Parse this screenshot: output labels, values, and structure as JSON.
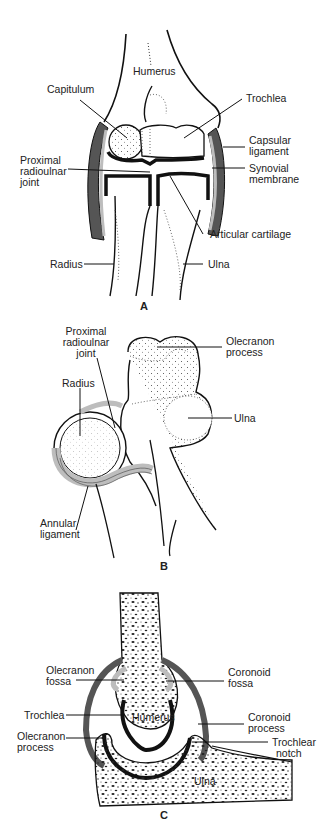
{
  "figure": {
    "panels": [
      {
        "id": "A",
        "letter": "A",
        "labels": {
          "humerus": "Humerus",
          "capitulum": "Capitulum",
          "trochlea": "Trochlea",
          "capsular_ligament_1": "Capsular",
          "capsular_ligament_2": "ligament",
          "proximal_radioulnar_1": "Proximal",
          "proximal_radioulnar_2": "radioulnar",
          "proximal_radioulnar_3": "joint",
          "synovial_membrane_1": "Synovial",
          "synovial_membrane_2": "membrane",
          "articular_cartilage": "Articular cartilage",
          "radius": "Radius",
          "ulna": "Ulna"
        }
      },
      {
        "id": "B",
        "letter": "B",
        "labels": {
          "proximal_radioulnar_1": "Proximal",
          "proximal_radioulnar_2": "radioulnar",
          "proximal_radioulnar_3": "joint",
          "olecranon_process_1": "Olecranon",
          "olecranon_process_2": "process",
          "radius": "Radius",
          "ulna": "Ulna",
          "annular_ligament_1": "Annular",
          "annular_ligament_2": "ligament"
        }
      },
      {
        "id": "C",
        "letter": "C",
        "labels": {
          "olecranon_fossa_1": "Olecranon",
          "olecranon_fossa_2": "fossa",
          "coronoid_fossa_1": "Coronoid",
          "coronoid_fossa_2": "fossa",
          "trochlea": "Trochlea",
          "humerus": "Humerus",
          "coronoid_process_1": "Coronoid",
          "coronoid_process_2": "process",
          "olecranon_process_1": "Olecranon",
          "olecranon_process_2": "process",
          "trochlear_notch_1": "Trochlear",
          "trochlear_notch_2": "notch",
          "ulna": "Ulna"
        }
      }
    ],
    "colors": {
      "ink": "#111111",
      "capsule_dark": "#555555",
      "capsule_light": "#bdbdbd",
      "background": "#ffffff"
    }
  }
}
